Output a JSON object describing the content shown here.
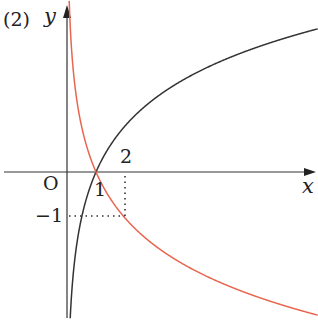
{
  "panel_label": "(2)",
  "axes": {
    "x_label": "x",
    "y_label": "y",
    "origin_label": "O"
  },
  "ticks": {
    "x_one": "1",
    "x_two": "2",
    "y_minus_one": "−1"
  },
  "curves": [
    {
      "name": "y = log_2 x",
      "color": "#333333",
      "description": "increasing logarithm through (1,0) and (2,1)"
    },
    {
      "name": "y = log_1/2 x",
      "color": "#e8664f",
      "description": "decreasing logarithm through (1,0) and (2,-1)"
    }
  ],
  "guides": {
    "point": [
      2,
      -1
    ],
    "style": "dotted"
  },
  "colors": {
    "axis": "#333333",
    "black_curve": "#333333",
    "red_curve": "#e8664f",
    "background": "#ffffff"
  }
}
